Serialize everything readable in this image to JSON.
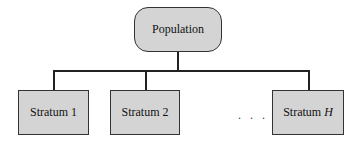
{
  "root": {
    "label": "Population"
  },
  "strata": [
    {
      "label": "Stratum 1",
      "italic_part": ""
    },
    {
      "label": "Stratum 2",
      "italic_part": ""
    },
    {
      "label": "Stratum ",
      "italic_part": "H"
    }
  ],
  "ellipsis": ". . .",
  "colors": {
    "fill": "#d4d4d4",
    "stroke": "#333333"
  }
}
